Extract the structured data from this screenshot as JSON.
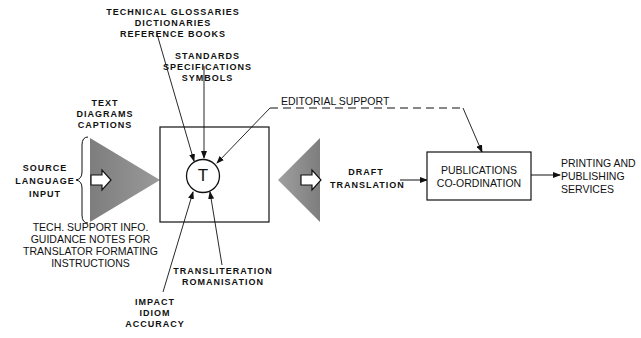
{
  "diagram": {
    "translator_symbol": "T",
    "labels": {
      "reference": [
        "TECHNICAL GLOSSARIES",
        "DICTIONARIES",
        "REFERENCE BOOKS"
      ],
      "standards": [
        "STANDARDS",
        "SPECIFICATIONS",
        "SYMBOLS"
      ],
      "editorial": [
        "EDITORIAL SUPPORT"
      ],
      "text_items": [
        "TEXT",
        "DIAGRAMS",
        "CAPTIONS"
      ],
      "source": [
        "SOURCE",
        "LANGUAGE",
        "INPUT"
      ],
      "tech_support": [
        "TECH. SUPPORT INFO.",
        "GUIDANCE NOTES FOR",
        "TRANSLATOR FORMATING",
        "INSTRUCTIONS"
      ],
      "transliteration": [
        "TRANSLITERATION",
        "ROMANISATION"
      ],
      "impact": [
        "IMPACT",
        "IDIOM",
        "ACCURACY"
      ],
      "draft": [
        "DRAFT",
        "TRANSLATION"
      ],
      "publications": [
        "PUBLICATIONS",
        "CO-ORDINATION"
      ],
      "printing": [
        "PRINTING AND",
        "PUBLISHING",
        "SERVICES"
      ]
    },
    "colors": {
      "line": "#111111",
      "triangle_fill": "#8a8a8a",
      "background": "#ffffff"
    }
  }
}
